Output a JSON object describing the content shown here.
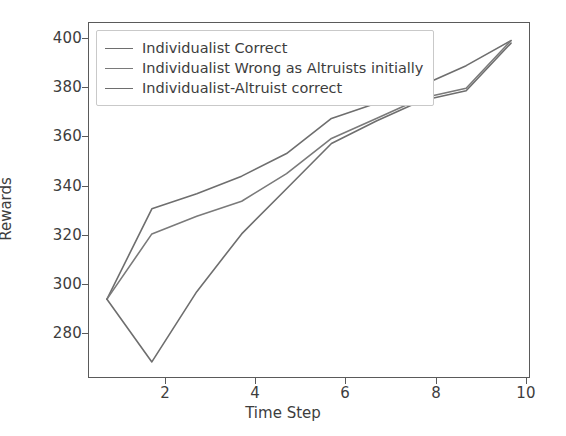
{
  "chart_data": {
    "type": "line",
    "title": "",
    "xlabel": "Time Step",
    "ylabel": "Rewards",
    "xlim": [
      0.6,
      10.4
    ],
    "ylim": [
      265,
      406
    ],
    "xticks": [
      2,
      4,
      6,
      8,
      10
    ],
    "yticks": [
      280,
      300,
      320,
      340,
      360,
      380,
      400
    ],
    "grid": false,
    "legend_position": "upper left",
    "x": [
      1,
      2,
      3,
      4,
      5,
      6,
      7,
      8,
      9,
      10
    ],
    "series": [
      {
        "name": "Individualist Correct",
        "color": "#6e6e6e",
        "values": [
          296,
          332,
          338,
          345,
          354,
          368,
          374,
          381,
          389,
          399
        ]
      },
      {
        "name": "Individualist Wrong as Altruists initially",
        "color": "#7a7a7a",
        "values": [
          296,
          322,
          329,
          335,
          346,
          360,
          368,
          376,
          380,
          399
        ]
      },
      {
        "name": "Individualist-Altruist correct",
        "color": "#6e6e6e",
        "values": [
          296,
          271,
          299,
          322,
          340,
          358,
          367,
          375,
          379,
          398
        ]
      }
    ]
  },
  "axis": {
    "ylabel": "Rewards",
    "xlabel": "Time Step",
    "ytick_labels": [
      "400",
      "380",
      "360",
      "340",
      "320",
      "300",
      "280"
    ],
    "xtick_labels": [
      "2",
      "4",
      "6",
      "8",
      "10"
    ]
  },
  "legend": {
    "items": [
      {
        "label": "Individualist Correct"
      },
      {
        "label": "Individualist Wrong as Altruists initially"
      },
      {
        "label": "Individualist-Altruist correct"
      }
    ]
  },
  "colors": {
    "line_1": "#6e6e6e",
    "line_2": "#7a7a7a",
    "line_3": "#6e6e6e",
    "axis": "#5a5a5a",
    "text": "#3d3d3d",
    "background": "#ffffff"
  }
}
